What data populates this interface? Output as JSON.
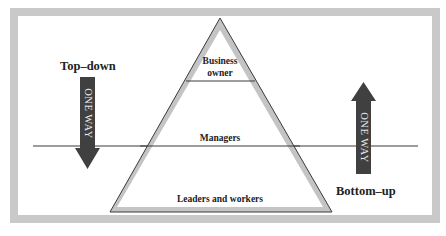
{
  "diagram": {
    "colors": {
      "frame": "#c9c9c9",
      "triangle_band": "#c4c4c4",
      "outline": "#3a3a3a",
      "arrow": "#404040",
      "arrow_text": "#e8e8e8",
      "label_text": "#222222"
    },
    "pyramid": {
      "tiers": [
        {
          "label_line1": "Business",
          "label_line2": "owner"
        },
        {
          "label": "Managers"
        },
        {
          "label": "Leaders and workers"
        }
      ]
    },
    "left_arrow": {
      "title": "Top–down",
      "text": "ONE WAY",
      "direction": "down"
    },
    "right_arrow": {
      "title": "Bottom–up",
      "text": "ONE WAY",
      "direction": "up"
    }
  }
}
